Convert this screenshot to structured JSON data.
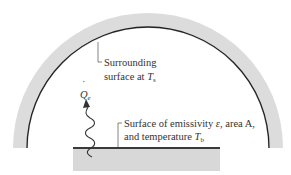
{
  "diagram": {
    "colors": {
      "enclosure_fill": "#dcdcdc",
      "enclosure_inner_edge": "#222222",
      "plate_edge": "#3a3a3a",
      "plate_fill": "#d6d6d6",
      "leader": "#555555",
      "text": "#333333"
    },
    "surrounding_label": {
      "line1": "Surrounding",
      "line2_prefix": "surface at ",
      "symbol": "T",
      "subscript": "s"
    },
    "heat_label": {
      "symbol": "Q",
      "dot": "˙",
      "subscript": "e"
    },
    "surface_label": {
      "line1_prefix": "Surface of emissivity ",
      "emissivity_symbol": "ε",
      "line1_suffix": ", area A,",
      "line2_prefix": "and temperature ",
      "symbol": "T",
      "subscript": "b"
    }
  }
}
